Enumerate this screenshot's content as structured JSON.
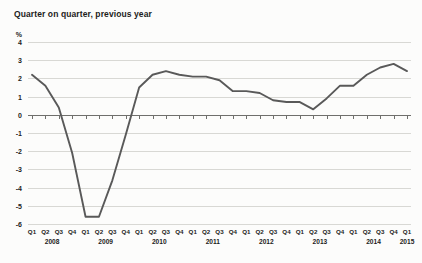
{
  "chart_data": {
    "type": "line",
    "title": "Quarter on quarter, previous year",
    "xlabel": "",
    "ylabel": "%",
    "ylim": [
      -6,
      4
    ],
    "yticks": [
      4,
      3,
      2,
      1,
      0,
      -1,
      -2,
      -3,
      -4,
      -5,
      -6
    ],
    "ytick_labels": [
      "4",
      "3",
      "2",
      "1",
      "0",
      "-1",
      "-2",
      "-3",
      "-4",
      "-5",
      "-6"
    ],
    "grid": true,
    "legend": "none",
    "quarter_labels": [
      "Q1",
      "Q2",
      "Q3",
      "Q4",
      "Q1",
      "Q2",
      "Q3",
      "Q4",
      "Q1",
      "Q2",
      "Q3",
      "Q4",
      "Q1",
      "Q2",
      "Q3",
      "Q4",
      "Q1",
      "Q2",
      "Q3",
      "Q4",
      "Q1",
      "Q2",
      "Q3",
      "Q4",
      "Q1",
      "Q2",
      "Q3",
      "Q4",
      "Q1"
    ],
    "year_labels": [
      "2008",
      "2009",
      "2010",
      "2011",
      "2012",
      "2013",
      "2014",
      "2015"
    ],
    "year_first_index": [
      0,
      4,
      8,
      12,
      16,
      20,
      24,
      28
    ],
    "categories": [
      "Q1 2008",
      "Q2 2008",
      "Q3 2008",
      "Q4 2008",
      "Q1 2009",
      "Q2 2009",
      "Q3 2009",
      "Q4 2009",
      "Q1 2010",
      "Q2 2010",
      "Q3 2010",
      "Q4 2010",
      "Q1 2011",
      "Q2 2011",
      "Q3 2011",
      "Q4 2011",
      "Q1 2012",
      "Q2 2012",
      "Q3 2012",
      "Q4 2012",
      "Q1 2013",
      "Q2 2013",
      "Q3 2013",
      "Q4 2013",
      "Q1 2014",
      "Q2 2014",
      "Q3 2014",
      "Q4 2014",
      "Q1 2015"
    ],
    "values": [
      2.2,
      1.6,
      0.4,
      -2.1,
      -5.6,
      -5.6,
      -3.6,
      -1.1,
      1.5,
      2.2,
      2.4,
      2.2,
      2.1,
      2.1,
      1.9,
      1.3,
      1.3,
      1.2,
      0.8,
      0.7,
      0.7,
      0.3,
      0.9,
      1.6,
      1.6,
      2.2,
      2.6,
      2.8,
      2.4
    ],
    "series_color": "#595959",
    "gridline_color": "#d8d8d4",
    "axis_color": "#6f6f6c",
    "background": "#fcfcfb"
  }
}
